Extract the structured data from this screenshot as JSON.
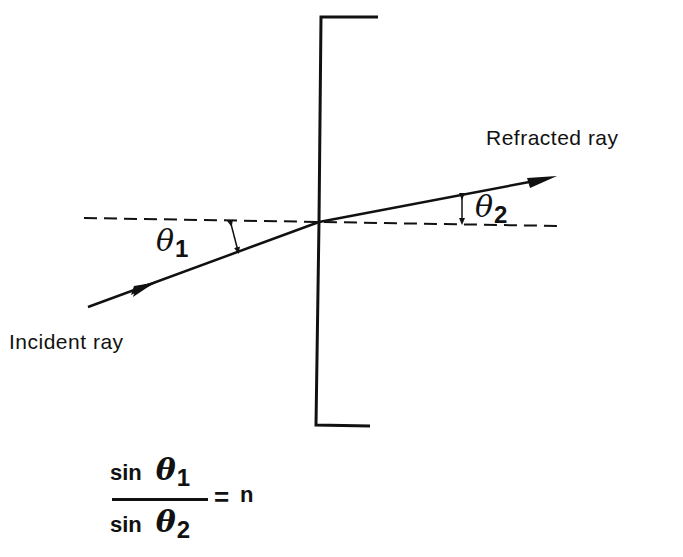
{
  "diagram": {
    "labels": {
      "refracted_ray": "Refracted ray",
      "incident_ray": "Incident ray",
      "theta1_symbol": "θ",
      "theta1_subscript": "1",
      "theta2_symbol": "θ",
      "theta2_subscript": "2"
    },
    "equation": {
      "numerator_fn": "sin",
      "numerator_symbol": "θ",
      "numerator_subscript": "1",
      "denominator_fn": "sin",
      "denominator_symbol": "θ",
      "denominator_subscript": "2",
      "equals": "=",
      "rhs": "n"
    },
    "elements": [
      "interface line with bracket ends (top and bottom)",
      "dashed horizontal normal line",
      "incident ray with arrow, below normal on left",
      "refracted ray with arrow, above normal on right",
      "angle markers θ1 and θ2 (double-headed arrows)"
    ],
    "colors": {
      "ink": "#111111",
      "background": "#ffffff"
    }
  }
}
